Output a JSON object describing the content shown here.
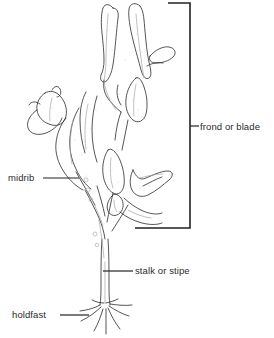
{
  "figure": {
    "style": "black-and-white-line-drawing",
    "background_color": "#ffffff",
    "ink_color": "#222222",
    "light_ink_color": "#9a9a9a"
  },
  "labels": {
    "frond": "frond or blade",
    "midrib": "midrib",
    "stalk": "stalk or stipe",
    "holdfast": "holdfast"
  },
  "annotations": {
    "bracket": {
      "name": "frond-or-blade-bracket",
      "orientation": "right-facing",
      "top_y": 3,
      "bottom_y": 228,
      "spine_x": 190
    },
    "leaders": [
      {
        "name": "midrib-leader",
        "from_x": 43,
        "to_x": 79,
        "y": 178
      },
      {
        "name": "stalk-leader",
        "from_x": 103,
        "to_x": 133,
        "y": 271
      },
      {
        "name": "holdfast-leader",
        "from_x": 60,
        "to_x": 89,
        "y": 315
      },
      {
        "name": "frond-leader",
        "from_x": 190,
        "to_x": 199,
        "y": 126
      }
    ]
  }
}
